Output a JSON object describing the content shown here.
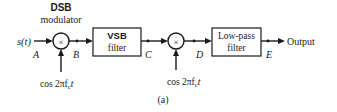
{
  "diagram": {
    "type": "block-diagram",
    "subfigure_label": "(a)",
    "input": {
      "label": "s(t)",
      "point": "A"
    },
    "blocks": [
      {
        "id": "dsb",
        "type": "multiplier",
        "symbol": "×",
        "title_line1": "DSB",
        "title_line2": "modulator",
        "carrier": "cos 2πf",
        "carrier_sub": "c",
        "carrier_t": "t"
      },
      {
        "id": "vsb",
        "type": "filter",
        "line1": "VSB",
        "line2": "filter"
      },
      {
        "id": "demod",
        "type": "multiplier",
        "symbol": "×",
        "carrier": "cos 2πf",
        "carrier_sub": "c",
        "carrier_t": "t"
      },
      {
        "id": "lpf",
        "type": "filter",
        "line1": "Low-pass",
        "line2": "filter"
      }
    ],
    "points": [
      "A",
      "B",
      "C",
      "D",
      "E"
    ],
    "output": {
      "label": "Output"
    },
    "connections": [
      {
        "from": "s(t)",
        "to": "dsb",
        "point": "A"
      },
      {
        "from": "dsb",
        "to": "vsb",
        "point": "B"
      },
      {
        "from": "vsb",
        "to": "demod",
        "point": "C"
      },
      {
        "from": "demod",
        "to": "lpf",
        "point": "D"
      },
      {
        "from": "lpf",
        "to": "Output",
        "point": "E"
      }
    ]
  }
}
